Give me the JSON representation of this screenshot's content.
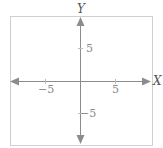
{
  "diagram": {
    "type": "coordinate-plane",
    "axes": {
      "x": {
        "label": "X",
        "min": -10,
        "max": 10
      },
      "y": {
        "label": "Y",
        "min": -10,
        "max": 10
      }
    },
    "tick_labels": {
      "x_neg": "−5",
      "x_pos": "5",
      "y_pos": "5",
      "y_neg": "−5"
    },
    "colors": {
      "frame": "#cfcfcf",
      "axis": "#8c8c8c",
      "arrow": "#8c8c8c",
      "text": "#8a8a8a"
    }
  }
}
